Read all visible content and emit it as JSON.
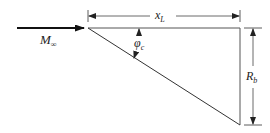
{
  "diagram": {
    "labels": {
      "freestream_mach": {
        "main": "M",
        "sub": "∞"
      },
      "length": {
        "main": "x",
        "sub": "L"
      },
      "base_radius": {
        "main": "R",
        "sub": "b"
      },
      "cone_angle": {
        "main": "φ",
        "sub": "c"
      }
    },
    "colors": {
      "stroke": "#333333",
      "arrow": "#111111",
      "background": "#ffffff"
    }
  }
}
